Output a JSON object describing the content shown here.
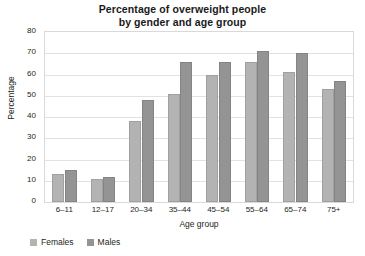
{
  "chart_data": {
    "type": "bar",
    "title": "Percentage of overweight people by gender and age group",
    "title_lines": [
      "Percentage of overweight people",
      "by gender and age group"
    ],
    "xlabel": "Age group",
    "ylabel": "Percentage",
    "ylim": [
      0,
      80
    ],
    "ytick_step": 10,
    "yticks": [
      "0",
      "10",
      "20",
      "30",
      "40",
      "50",
      "60",
      "70",
      "80"
    ],
    "grid": true,
    "legend_position": "bottom-left",
    "categories": [
      "6–11",
      "12–17",
      "20–34",
      "35–44",
      "45–54",
      "55–64",
      "65–74",
      "75+"
    ],
    "series": [
      {
        "name": "Females",
        "color": "#b3b3b3",
        "values": [
          13,
          11,
          38,
          51,
          60,
          66,
          61,
          53
        ]
      },
      {
        "name": "Males",
        "color": "#949494",
        "values": [
          15,
          12,
          48,
          66,
          66,
          71,
          70,
          57
        ]
      }
    ]
  }
}
